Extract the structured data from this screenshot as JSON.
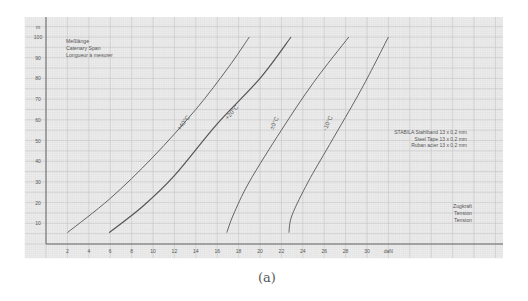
{
  "chart_data": {
    "type": "line",
    "title": "",
    "legend_title": [
      "Meßlänge",
      "Catenary Span",
      "Longueur à mesurer"
    ],
    "xlabel": "daN",
    "ylabel": "m",
    "xlabel_box": [
      "Zugkraft",
      "Tension",
      "Tension"
    ],
    "annotation": [
      "STABILA Stahlband 13 x 0,2 mm",
      "Steel Tape 13 x 0,2 mm",
      "Ruban acier 13 x 0,2 mm"
    ],
    "xticks": [
      2,
      4,
      6,
      8,
      10,
      12,
      14,
      16,
      18,
      20,
      22,
      24,
      26,
      28,
      30
    ],
    "yticks": [
      10,
      20,
      30,
      40,
      50,
      60,
      70,
      80,
      90,
      100
    ],
    "xlim": [
      0,
      42
    ],
    "ylim": [
      0,
      105
    ],
    "grid": true,
    "series": [
      {
        "name": "+40°C",
        "x": [
          2,
          6,
          10,
          14,
          17,
          19
        ],
        "y": [
          5.5,
          22,
          42,
          65,
          85,
          100
        ]
      },
      {
        "name": "+20°C",
        "x": [
          5.9,
          9,
          12,
          16,
          20,
          22.9
        ],
        "y": [
          5.5,
          18,
          33,
          58,
          80,
          100
        ]
      },
      {
        "name": "±0°C",
        "x": [
          16.9,
          17.5,
          19,
          22,
          25,
          28.3
        ],
        "y": [
          5.5,
          14,
          30,
          55,
          78,
          100
        ]
      },
      {
        "name": "-10°C",
        "x": [
          22.7,
          23,
          24.5,
          26.5,
          29.5,
          32
        ],
        "y": [
          5.5,
          14,
          30,
          48,
          75,
          100
        ]
      }
    ]
  },
  "caption": "(a)"
}
